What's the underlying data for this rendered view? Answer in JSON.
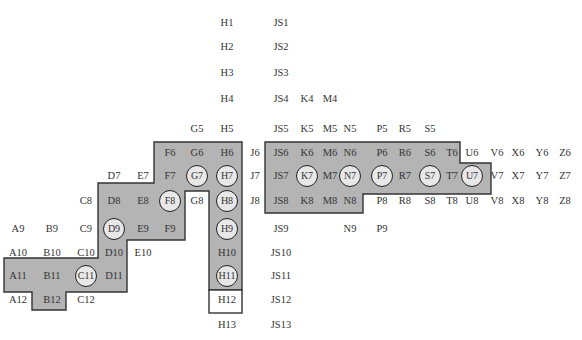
{
  "diagram": {
    "colors": {
      "zone_fill": "#b4b4b4",
      "zone_stroke": "#333333",
      "circle_fill": "#e8e8e8",
      "box_fill": "#ffffff"
    },
    "columns": {
      "A": 18,
      "B": 52,
      "C": 86,
      "D": 114,
      "E": 143,
      "F": 170,
      "G": 197,
      "H": 227,
      "J": 255,
      "JS": 281,
      "K": 307,
      "M": 330,
      "N": 350,
      "P": 382,
      "R": 405,
      "S": 430,
      "T": 452,
      "U": 472,
      "V": 497,
      "X": 518,
      "Y": 542,
      "Z": 565
    },
    "rows": {
      "1": 23,
      "2": 47,
      "3": 73,
      "4": 99,
      "5": 129,
      "6": 153,
      "7": 176,
      "8": 201,
      "9": 229,
      "10": 253,
      "11": 276,
      "12": 300,
      "13": 325
    },
    "zones": [
      {
        "name": "left-zone",
        "points": "154,142 242,142 242,290 209,290 209,191 185,191 185,240 127,240 127,292 66,292 66,310 32,310 32,292 4,292 4,258 98,258 98,183 154,183"
      },
      {
        "name": "right-zone",
        "points": "265,142 460,142 460,163 491,163 491,194 363,194 363,213 265,213"
      }
    ],
    "boxes": [
      {
        "name": "h12-box",
        "x": 209,
        "y": 290,
        "w": 33,
        "h": 23
      }
    ],
    "labels": [
      {
        "id": "H1",
        "col": "H",
        "row": "1"
      },
      {
        "id": "JS1",
        "col": "JS",
        "row": "1"
      },
      {
        "id": "H2",
        "col": "H",
        "row": "2"
      },
      {
        "id": "JS2",
        "col": "JS",
        "row": "2"
      },
      {
        "id": "H3",
        "col": "H",
        "row": "3"
      },
      {
        "id": "JS3",
        "col": "JS",
        "row": "3"
      },
      {
        "id": "H4",
        "col": "H",
        "row": "4"
      },
      {
        "id": "JS4",
        "col": "JS",
        "row": "4"
      },
      {
        "id": "K4",
        "col": "K",
        "row": "4"
      },
      {
        "id": "M4",
        "col": "M",
        "row": "4"
      },
      {
        "id": "G5",
        "col": "G",
        "row": "5"
      },
      {
        "id": "H5",
        "col": "H",
        "row": "5"
      },
      {
        "id": "JS5",
        "col": "JS",
        "row": "5"
      },
      {
        "id": "K5",
        "col": "K",
        "row": "5"
      },
      {
        "id": "M5",
        "col": "M",
        "row": "5"
      },
      {
        "id": "N5",
        "col": "N",
        "row": "5"
      },
      {
        "id": "P5",
        "col": "P",
        "row": "5"
      },
      {
        "id": "R5",
        "col": "R",
        "row": "5"
      },
      {
        "id": "S5",
        "col": "S",
        "row": "5"
      },
      {
        "id": "F6",
        "col": "F",
        "row": "6"
      },
      {
        "id": "G6",
        "col": "G",
        "row": "6"
      },
      {
        "id": "H6",
        "col": "H",
        "row": "6"
      },
      {
        "id": "J6",
        "col": "J",
        "row": "6"
      },
      {
        "id": "JS6",
        "col": "JS",
        "row": "6"
      },
      {
        "id": "K6",
        "col": "K",
        "row": "6"
      },
      {
        "id": "M6",
        "col": "M",
        "row": "6"
      },
      {
        "id": "N6",
        "col": "N",
        "row": "6"
      },
      {
        "id": "P6",
        "col": "P",
        "row": "6"
      },
      {
        "id": "R6",
        "col": "R",
        "row": "6"
      },
      {
        "id": "S6",
        "col": "S",
        "row": "6"
      },
      {
        "id": "T6",
        "col": "T",
        "row": "6"
      },
      {
        "id": "U6",
        "col": "U",
        "row": "6"
      },
      {
        "id": "V6",
        "col": "V",
        "row": "6"
      },
      {
        "id": "X6",
        "col": "X",
        "row": "6"
      },
      {
        "id": "Y6",
        "col": "Y",
        "row": "6"
      },
      {
        "id": "Z6",
        "col": "Z",
        "row": "6"
      },
      {
        "id": "D7",
        "col": "D",
        "row": "7"
      },
      {
        "id": "E7",
        "col": "E",
        "row": "7"
      },
      {
        "id": "F7",
        "col": "F",
        "row": "7"
      },
      {
        "id": "G7",
        "col": "G",
        "row": "7",
        "circled": true
      },
      {
        "id": "H7",
        "col": "H",
        "row": "7",
        "circled": true
      },
      {
        "id": "J7",
        "col": "J",
        "row": "7"
      },
      {
        "id": "JS7",
        "col": "JS",
        "row": "7"
      },
      {
        "id": "K7",
        "col": "K",
        "row": "7",
        "circled": true
      },
      {
        "id": "M7",
        "col": "M",
        "row": "7"
      },
      {
        "id": "N7",
        "col": "N",
        "row": "7",
        "circled": true
      },
      {
        "id": "P7",
        "col": "P",
        "row": "7",
        "circled": true
      },
      {
        "id": "R7",
        "col": "R",
        "row": "7"
      },
      {
        "id": "S7",
        "col": "S",
        "row": "7",
        "circled": true
      },
      {
        "id": "T7",
        "col": "T",
        "row": "7"
      },
      {
        "id": "U7",
        "col": "U",
        "row": "7",
        "circled": true
      },
      {
        "id": "V7",
        "col": "V",
        "row": "7"
      },
      {
        "id": "X7",
        "col": "X",
        "row": "7"
      },
      {
        "id": "Y7",
        "col": "Y",
        "row": "7"
      },
      {
        "id": "Z7",
        "col": "Z",
        "row": "7"
      },
      {
        "id": "C8",
        "col": "C",
        "row": "8"
      },
      {
        "id": "D8",
        "col": "D",
        "row": "8"
      },
      {
        "id": "E8",
        "col": "E",
        "row": "8"
      },
      {
        "id": "F8",
        "col": "F",
        "row": "8",
        "circled": true
      },
      {
        "id": "G8",
        "col": "G",
        "row": "8"
      },
      {
        "id": "H8",
        "col": "H",
        "row": "8",
        "circled": true
      },
      {
        "id": "J8",
        "col": "J",
        "row": "8"
      },
      {
        "id": "JS8",
        "col": "JS",
        "row": "8"
      },
      {
        "id": "K8",
        "col": "K",
        "row": "8"
      },
      {
        "id": "M8",
        "col": "M",
        "row": "8"
      },
      {
        "id": "N8",
        "col": "N",
        "row": "8"
      },
      {
        "id": "P8",
        "col": "P",
        "row": "8"
      },
      {
        "id": "R8",
        "col": "R",
        "row": "8"
      },
      {
        "id": "S8",
        "col": "S",
        "row": "8"
      },
      {
        "id": "T8",
        "col": "T",
        "row": "8"
      },
      {
        "id": "U8",
        "col": "U",
        "row": "8"
      },
      {
        "id": "V8",
        "col": "V",
        "row": "8"
      },
      {
        "id": "X8",
        "col": "X",
        "row": "8"
      },
      {
        "id": "Y8",
        "col": "Y",
        "row": "8"
      },
      {
        "id": "Z8",
        "col": "Z",
        "row": "8"
      },
      {
        "id": "A9",
        "col": "A",
        "row": "9"
      },
      {
        "id": "B9",
        "col": "B",
        "row": "9"
      },
      {
        "id": "C9",
        "col": "C",
        "row": "9"
      },
      {
        "id": "D9",
        "col": "D",
        "row": "9",
        "circled": true
      },
      {
        "id": "E9",
        "col": "E",
        "row": "9"
      },
      {
        "id": "F9",
        "col": "F",
        "row": "9"
      },
      {
        "id": "H9",
        "col": "H",
        "row": "9",
        "circled": true
      },
      {
        "id": "JS9",
        "col": "JS",
        "row": "9"
      },
      {
        "id": "N9",
        "col": "N",
        "row": "9"
      },
      {
        "id": "P9",
        "col": "P",
        "row": "9"
      },
      {
        "id": "A10",
        "col": "A",
        "row": "10"
      },
      {
        "id": "B10",
        "col": "B",
        "row": "10"
      },
      {
        "id": "C10",
        "col": "C",
        "row": "10"
      },
      {
        "id": "D10",
        "col": "D",
        "row": "10"
      },
      {
        "id": "E10",
        "col": "E",
        "row": "10"
      },
      {
        "id": "H10",
        "col": "H",
        "row": "10"
      },
      {
        "id": "JS10",
        "col": "JS",
        "row": "10"
      },
      {
        "id": "A11",
        "col": "A",
        "row": "11"
      },
      {
        "id": "B11",
        "col": "B",
        "row": "11"
      },
      {
        "id": "C11",
        "col": "C",
        "row": "11",
        "circled": true
      },
      {
        "id": "D11",
        "col": "D",
        "row": "11"
      },
      {
        "id": "H11",
        "col": "H",
        "row": "11",
        "circled": true
      },
      {
        "id": "JS11",
        "col": "JS",
        "row": "11"
      },
      {
        "id": "A12",
        "col": "A",
        "row": "12"
      },
      {
        "id": "B12",
        "col": "B",
        "row": "12"
      },
      {
        "id": "C12",
        "col": "C",
        "row": "12"
      },
      {
        "id": "H12",
        "col": "H",
        "row": "12"
      },
      {
        "id": "JS12",
        "col": "JS",
        "row": "12"
      },
      {
        "id": "H13",
        "col": "H",
        "row": "13"
      },
      {
        "id": "JS13",
        "col": "JS",
        "row": "13"
      }
    ]
  }
}
